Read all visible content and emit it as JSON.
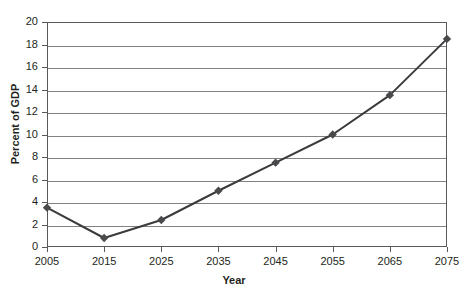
{
  "top_clipped_text": "",
  "chart_data": {
    "type": "line",
    "title": "",
    "xlabel": "Year",
    "ylabel": "Percent of GDP",
    "x": [
      2005,
      2015,
      2025,
      2035,
      2045,
      2055,
      2065,
      2075
    ],
    "xtick_labels": [
      "2005",
      "2015",
      "2025",
      "2035",
      "2045",
      "2055",
      "2065",
      "2075"
    ],
    "values": [
      3.5,
      0.8,
      2.4,
      5.0,
      7.5,
      10.0,
      13.5,
      18.5
    ],
    "ytick_labels": [
      "0",
      "2",
      "4",
      "6",
      "8",
      "10",
      "12",
      "14",
      "16",
      "18",
      "20"
    ],
    "yticks": [
      0,
      2,
      4,
      6,
      8,
      10,
      12,
      14,
      16,
      18,
      20
    ],
    "ylim": [
      0,
      20
    ],
    "xlim": [
      2005,
      2075
    ],
    "grid": "horizontal",
    "legend": "none",
    "marker": "diamond",
    "line_color": "#3b3b3d",
    "marker_color": "#4a4a4c",
    "grid_color": "#808285",
    "axis_color": "#58595b"
  }
}
